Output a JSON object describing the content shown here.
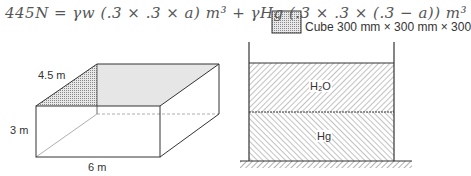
{
  "annotation": {
    "handwritten_equation": "445N = γw (.3 × .3 × a) m³ + γHg (.3 × .3 × (.3 − a)) m³"
  },
  "cube": {
    "label": "Cube 300 mm × 300 mm × 300"
  },
  "tank": {
    "width_label": "6 m",
    "depth_label": "4.5 m",
    "height_label": "3 m"
  },
  "container": {
    "upper_fluid_label": "H₂O",
    "lower_fluid_label": "Hg"
  },
  "colors": {
    "line": "#333333",
    "hatch": "#555555",
    "stipple": "#bbbbbb",
    "top_face": "#e6e6e6"
  }
}
